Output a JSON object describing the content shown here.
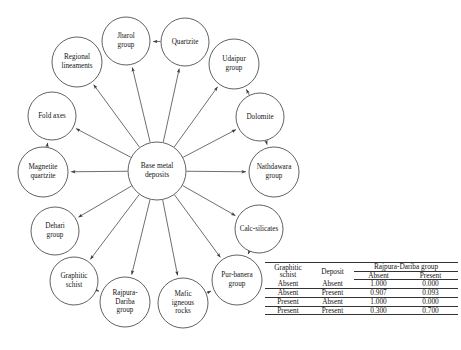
{
  "diagram": {
    "type": "bayesian-network-influence-diagram",
    "center_node": {
      "id": "base-metal-deposits",
      "label_lines": [
        "Base metal",
        "deposits"
      ],
      "cx": 157,
      "cy": 171,
      "r": 29
    },
    "nodes": [
      {
        "id": "jharol-group",
        "label_lines": [
          "Jharol",
          "group"
        ],
        "cx": 126,
        "cy": 41,
        "r": 24
      },
      {
        "id": "quartzite",
        "label_lines": [
          "Quartzite"
        ],
        "cx": 185,
        "cy": 42,
        "r": 24
      },
      {
        "id": "regional-lineaments",
        "label_lines": [
          "Regional",
          "lineaments"
        ],
        "cx": 77,
        "cy": 62,
        "r": 25
      },
      {
        "id": "udaipur-group",
        "label_lines": [
          "Udaipur",
          "group"
        ],
        "cx": 234,
        "cy": 64,
        "r": 25
      },
      {
        "id": "fold-axes",
        "label_lines": [
          "Fold axes"
        ],
        "cx": 52,
        "cy": 116,
        "r": 24
      },
      {
        "id": "dolomite",
        "label_lines": [
          "Dolomite"
        ],
        "cx": 260,
        "cy": 117,
        "r": 24
      },
      {
        "id": "magnetite-quartzite",
        "label_lines": [
          "Magnetite",
          "quartzite"
        ],
        "cx": 43,
        "cy": 172,
        "r": 25
      },
      {
        "id": "nathdawara-group",
        "label_lines": [
          "Nathdawara",
          "group"
        ],
        "cx": 274,
        "cy": 172,
        "r": 25
      },
      {
        "id": "dehari-group",
        "label_lines": [
          "Dehari",
          "group"
        ],
        "cx": 55,
        "cy": 231,
        "r": 24
      },
      {
        "id": "calc-silicates",
        "label_lines": [
          "Calc-silicates"
        ],
        "cx": 259,
        "cy": 229,
        "r": 24
      },
      {
        "id": "graphitic-schist",
        "label_lines": [
          "Graphitic",
          "schist"
        ],
        "cx": 74,
        "cy": 281,
        "r": 24
      },
      {
        "id": "pur-banera-group",
        "label_lines": [
          "Pur-banera",
          "group"
        ],
        "cx": 237,
        "cy": 280,
        "r": 25
      },
      {
        "id": "rajpura-dariba-group",
        "label_lines": [
          "Rajpura-",
          "Dariba",
          "group"
        ],
        "cx": 125,
        "cy": 302,
        "r": 25
      },
      {
        "id": "mafic-igneous-rocks",
        "label_lines": [
          "Mafic",
          "igneous",
          "rocks"
        ],
        "cx": 183,
        "cy": 303,
        "r": 25
      }
    ],
    "edges": [
      {
        "from": "base-metal-deposits",
        "to": "jharol-group",
        "arrow": true
      },
      {
        "from": "base-metal-deposits",
        "to": "quartzite",
        "arrow": true
      },
      {
        "from": "base-metal-deposits",
        "to": "regional-lineaments",
        "arrow": true
      },
      {
        "from": "base-metal-deposits",
        "to": "udaipur-group",
        "arrow": true
      },
      {
        "from": "base-metal-deposits",
        "to": "fold-axes",
        "arrow": true
      },
      {
        "from": "base-metal-deposits",
        "to": "dolomite",
        "arrow": true
      },
      {
        "from": "base-metal-deposits",
        "to": "magnetite-quartzite",
        "arrow": true
      },
      {
        "from": "base-metal-deposits",
        "to": "nathdawara-group",
        "arrow": true
      },
      {
        "from": "base-metal-deposits",
        "to": "dehari-group",
        "arrow": true
      },
      {
        "from": "base-metal-deposits",
        "to": "calc-silicates",
        "arrow": true
      },
      {
        "from": "base-metal-deposits",
        "to": "graphitic-schist",
        "arrow": true
      },
      {
        "from": "base-metal-deposits",
        "to": "pur-banera-group",
        "arrow": true
      },
      {
        "from": "base-metal-deposits",
        "to": "rajpura-dariba-group",
        "arrow": true
      },
      {
        "from": "base-metal-deposits",
        "to": "mafic-igneous-rocks",
        "arrow": true
      },
      {
        "from": "quartzite",
        "to": "jharol-group",
        "arrow": true
      },
      {
        "from": "dolomite",
        "to": "udaipur-group",
        "arrow": true
      },
      {
        "from": "dolomite",
        "to": "nathdawara-group",
        "arrow": true
      },
      {
        "from": "magnetite-quartzite",
        "to": "fold-axes",
        "arrow": true
      },
      {
        "from": "calc-silicates",
        "to": "pur-banera-group",
        "arrow": true
      },
      {
        "from": "graphitic-schist",
        "to": "rajpura-dariba-group",
        "arrow": true
      },
      {
        "from": "mafic-igneous-rocks",
        "to": "pur-banera-group",
        "arrow": true
      }
    ],
    "colors": {
      "stroke": "#3a3a3a",
      "fill": "#ffffff",
      "text": "#161616"
    }
  },
  "table": {
    "caption": "",
    "group_header": "Rajpura-Dariba group",
    "headers": {
      "col1_lines": [
        "Graphitic",
        "schist"
      ],
      "col2": "Deposit",
      "sub1": "Absent",
      "sub2": "Present"
    },
    "rows": [
      {
        "graphitic_schist": "Absent",
        "deposit": "Absent",
        "absent": "1.000",
        "present": "0.000"
      },
      {
        "graphitic_schist": "Absent",
        "deposit": "Present",
        "absent": "0.907",
        "present": "0.093"
      },
      {
        "graphitic_schist": "Present",
        "deposit": "Absent",
        "absent": "1.000",
        "present": "0.000"
      },
      {
        "graphitic_schist": "Present",
        "deposit": "Present",
        "absent": "0.300",
        "present": "0.700"
      }
    ]
  }
}
